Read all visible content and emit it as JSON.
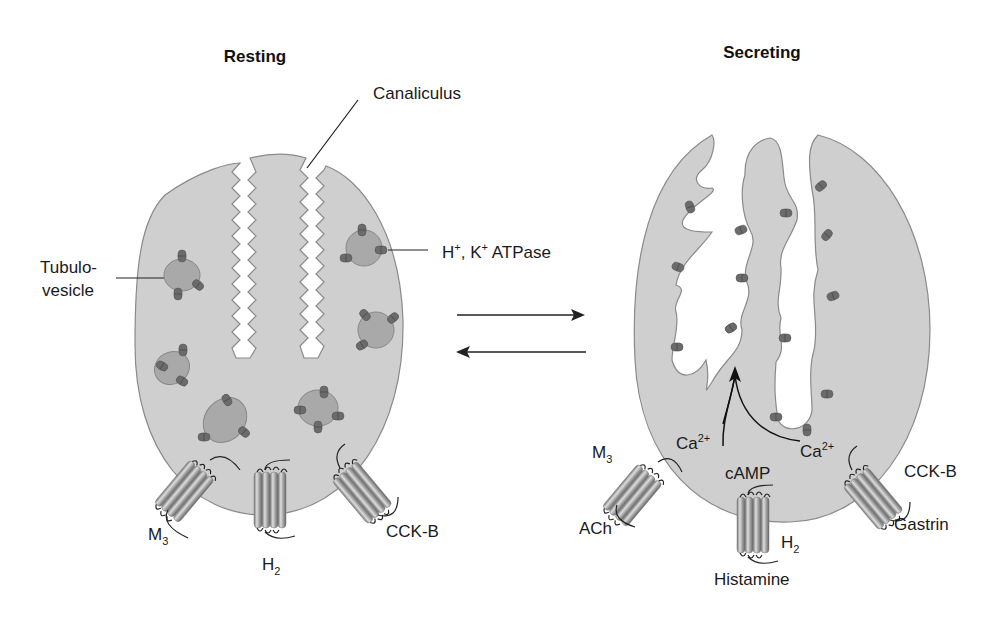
{
  "diagram": {
    "states": {
      "resting": {
        "title": "Resting",
        "labels": {
          "canaliculus": "Canaliculus",
          "tubulovesicle_line1": "Tubulo-",
          "tubulovesicle_line2": "vesicle",
          "atpase_h": "H",
          "atpase_h_sup": "+",
          "atpase_sep": ", K",
          "atpase_k_sup": "+",
          "atpase_rest": " ATPase"
        },
        "receptors": {
          "m3": {
            "base": "M",
            "sub": "3"
          },
          "h2": {
            "base": "H",
            "sub": "2"
          },
          "cckb": {
            "text": "CCK-B"
          }
        }
      },
      "secreting": {
        "title": "Secreting",
        "receptors": {
          "m3": {
            "base": "M",
            "sub": "3",
            "ligand": "ACh"
          },
          "h2": {
            "base": "H",
            "sub": "2",
            "ligand": "Histamine"
          },
          "cckb": {
            "text": "CCK-B",
            "ligand": "Gastrin"
          }
        },
        "second_messengers": {
          "ca_left": {
            "base": "Ca",
            "sup": "2+"
          },
          "camp": "cAMP",
          "ca_right": {
            "base": "Ca",
            "sup": "2+"
          }
        }
      }
    },
    "transition": {
      "forward": "resting-to-secreting",
      "reverse": "secreting-to-resting"
    },
    "colors": {
      "cell_fill": "#cfcfcf",
      "cell_stroke": "#8a8a8a",
      "vesicle_fill": "#a9a9a9",
      "pump": "#6b6b6b",
      "text": "#1a1a1a"
    }
  }
}
